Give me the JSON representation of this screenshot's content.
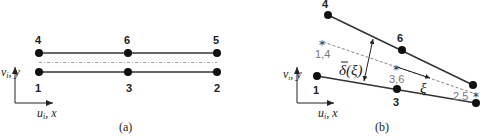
{
  "panel_a": {
    "caption": "(a)",
    "top_nodes": [
      {
        "label": "4",
        "x": 39,
        "y": 53
      },
      {
        "label": "6",
        "x": 128,
        "y": 53
      },
      {
        "label": "5",
        "x": 217,
        "y": 53
      }
    ],
    "bottom_nodes": [
      {
        "label": "1",
        "x": 39,
        "y": 72
      },
      {
        "label": "3",
        "x": 128,
        "y": 72
      },
      {
        "label": "2",
        "x": 217,
        "y": 72
      }
    ],
    "axis_y_label": "v",
    "axis_y_sub": "i",
    "axis_y_sep": ", y",
    "axis_x_label": "u",
    "axis_x_sub": "i",
    "axis_x_sep": ", x"
  },
  "panel_b": {
    "caption": "(b)",
    "top_nodes": [
      {
        "label": "4"
      },
      {
        "label": "6"
      }
    ],
    "bottom_nodes": [
      {
        "label": "1"
      },
      {
        "label": "3"
      }
    ],
    "midpoints": [
      {
        "label": "1,4"
      },
      {
        "label": "3,6"
      },
      {
        "label": "2,5"
      }
    ],
    "xi_label": "ξ",
    "delta_label": "δ(ξ)",
    "delta_bar": "‾",
    "axis_y_label": "v",
    "axis_y_sub": "i",
    "axis_y_sep": ", y",
    "axis_x_label": "u",
    "axis_x_sub": "i",
    "axis_x_sep": ", x"
  }
}
